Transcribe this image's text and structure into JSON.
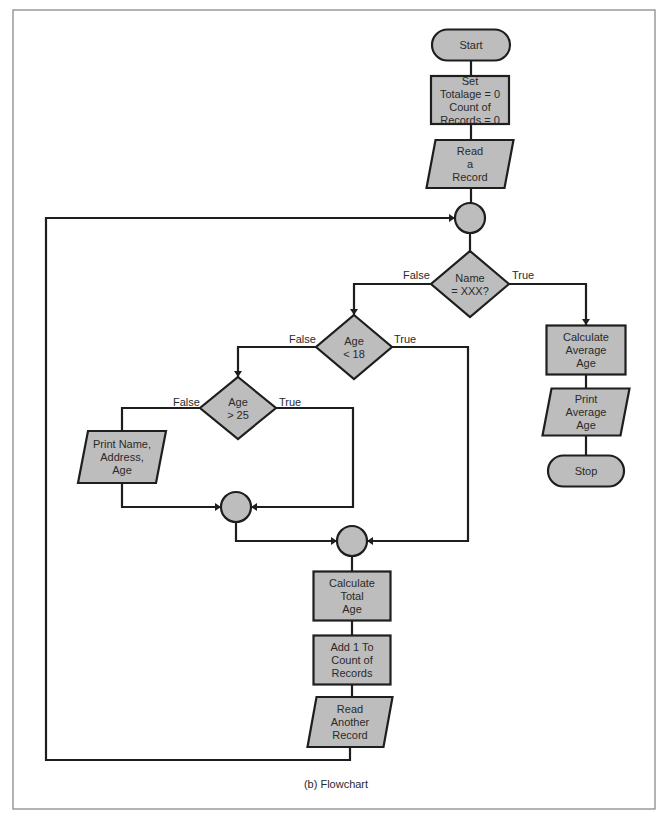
{
  "caption": "(b) Flowchart",
  "colors": {
    "shape_fill": "#bdbdbd",
    "stroke": "#1e1e1e",
    "frame": "#8a8a8a"
  },
  "nodes": {
    "start": {
      "type": "terminator",
      "lines": [
        "Start"
      ]
    },
    "init": {
      "type": "process",
      "lines": [
        "Set",
        "Totalage = 0",
        "Count of",
        "Records = 0"
      ]
    },
    "read_record": {
      "type": "io",
      "lines": [
        "Read",
        "a",
        "Record"
      ]
    },
    "junction_top": {
      "type": "connector",
      "lines": []
    },
    "name_check": {
      "type": "decision",
      "lines": [
        "Name",
        "= XXX?"
      ]
    },
    "age_lt_18": {
      "type": "decision",
      "lines": [
        "Age",
        "< 18"
      ]
    },
    "age_gt_25": {
      "type": "decision",
      "lines": [
        "Age",
        "> 25"
      ]
    },
    "print_name": {
      "type": "io",
      "lines": [
        "Print Name,",
        "Address,",
        "Age"
      ]
    },
    "junction_mid": {
      "type": "connector",
      "lines": []
    },
    "junction_low": {
      "type": "connector",
      "lines": []
    },
    "calc_total": {
      "type": "process",
      "lines": [
        "Calculate",
        "Total",
        "Age"
      ]
    },
    "add_count": {
      "type": "process",
      "lines": [
        "Add 1 To",
        "Count of",
        "Records"
      ]
    },
    "read_another": {
      "type": "io",
      "lines": [
        "Read",
        "Another",
        "Record"
      ]
    },
    "calc_average": {
      "type": "process",
      "lines": [
        "Calculate",
        "Average",
        "Age"
      ]
    },
    "print_average": {
      "type": "io",
      "lines": [
        "Print",
        "Average",
        "Age"
      ]
    },
    "stop": {
      "type": "terminator",
      "lines": [
        "Stop"
      ]
    }
  },
  "edge_labels": {
    "name_false": "False",
    "name_true": "True",
    "lt18_false": "False",
    "lt18_true": "True",
    "gt25_false": "False",
    "gt25_true": "True"
  },
  "edges": [
    {
      "from": "start",
      "to": "init"
    },
    {
      "from": "init",
      "to": "read_record"
    },
    {
      "from": "read_record",
      "to": "junction_top"
    },
    {
      "from": "junction_top",
      "to": "name_check"
    },
    {
      "from": "name_check",
      "to": "age_lt_18",
      "label": "False"
    },
    {
      "from": "name_check",
      "to": "calc_average",
      "label": "True"
    },
    {
      "from": "age_lt_18",
      "to": "age_gt_25",
      "label": "False"
    },
    {
      "from": "age_lt_18",
      "to": "junction_low",
      "label": "True"
    },
    {
      "from": "age_gt_25",
      "to": "print_name",
      "label": "False"
    },
    {
      "from": "age_gt_25",
      "to": "junction_mid",
      "label": "True"
    },
    {
      "from": "print_name",
      "to": "junction_mid"
    },
    {
      "from": "junction_mid",
      "to": "junction_low"
    },
    {
      "from": "junction_low",
      "to": "calc_total"
    },
    {
      "from": "calc_total",
      "to": "add_count"
    },
    {
      "from": "add_count",
      "to": "read_another"
    },
    {
      "from": "read_another",
      "to": "junction_top"
    },
    {
      "from": "calc_average",
      "to": "print_average"
    },
    {
      "from": "print_average",
      "to": "stop"
    }
  ]
}
